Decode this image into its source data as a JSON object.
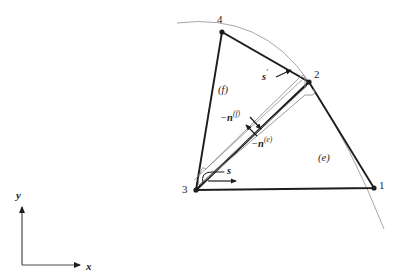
{
  "figure": {
    "background_color": "#ffffff",
    "line_color": "#1d1d1d",
    "thin_line_color": "#8a8a8a"
  },
  "axes": {
    "x_label": "x",
    "y_label": "y",
    "origin_px": [
      22,
      265
    ],
    "x_tip_px": [
      84,
      265
    ],
    "y_tip_px": [
      22,
      203
    ]
  },
  "nodes": [
    {
      "id": "1",
      "label": "1",
      "x": 374,
      "y": 188,
      "label_x": 379,
      "label_y": 180
    },
    {
      "id": "2",
      "label": "2",
      "x": 309,
      "y": 82,
      "label_x": 314,
      "label_y": 69
    },
    {
      "id": "3",
      "label": "3",
      "x": 196,
      "y": 190,
      "label_x": 182,
      "label_y": 184
    },
    {
      "id": "4",
      "label": "4",
      "x": 222,
      "y": 32,
      "label_x": 217,
      "label_y": 14
    }
  ],
  "elements": [
    {
      "id": "f",
      "label": "(f)",
      "nodes": [
        "3",
        "4",
        "2"
      ],
      "label_x": 218,
      "label_y": 85
    },
    {
      "id": "e",
      "label": "(e)",
      "nodes": [
        "3",
        "2",
        "1"
      ],
      "label_x": 318,
      "label_y": 153
    }
  ],
  "annotations": [
    {
      "name": "normal-f",
      "label_html": "−<b>n</b><sup>(f)</sup>",
      "label_x": 220,
      "label_y": 110,
      "arrow_from": [
        252,
        119
      ],
      "arrow_to": [
        261,
        129
      ]
    },
    {
      "name": "normal-e",
      "label_html": "−<b>n</b><sup>(e)</sup>",
      "label_x": 251,
      "label_y": 136,
      "arrow_from": [
        256,
        135
      ],
      "arrow_to": [
        246,
        125
      ]
    },
    {
      "name": "s-prime",
      "label_html": "s′",
      "label_x": 262,
      "label_y": 69,
      "arrow_from": [
        275,
        76
      ],
      "arrow_to": [
        291,
        69
      ]
    },
    {
      "name": "s-coord",
      "label_html": "s",
      "label_x": 227,
      "label_y": 168,
      "arrow_from": [
        209,
        180
      ],
      "arrow_to": [
        237,
        180
      ]
    }
  ],
  "curve": {
    "name": "domain-boundary-arc",
    "start_px": [
      177,
      23
    ],
    "control_px": [
      300,
      25
    ],
    "end_px": [
      384,
      229
    ]
  }
}
